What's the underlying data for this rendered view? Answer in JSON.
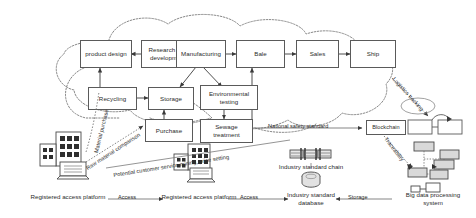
{
  "diagram": {
    "accent_color": "#5a5a5a",
    "background": "#ffffff"
  },
  "process_boxes": [
    {
      "id": "product-design",
      "label": "product design"
    },
    {
      "id": "research-development",
      "label": "Research and development"
    },
    {
      "id": "manufacturing",
      "label": "Manufacturing"
    },
    {
      "id": "bale",
      "label": "Bale"
    },
    {
      "id": "sales",
      "label": "Sales"
    },
    {
      "id": "ship",
      "label": "Ship"
    },
    {
      "id": "recycling",
      "label": "Recycling"
    },
    {
      "id": "storage",
      "label": "Storage"
    },
    {
      "id": "environmental-testing",
      "label": "Environmental testing"
    },
    {
      "id": "purchase",
      "label": "Purchase"
    },
    {
      "id": "sewage-treatment",
      "label": "Sewage treatment"
    },
    {
      "id": "blockchain",
      "label": "Blockchain"
    }
  ],
  "edge_labels": [
    {
      "id": "material-purchase",
      "text": "Material purchase"
    },
    {
      "id": "raw-material-comparison",
      "text": "Raw material comparison"
    },
    {
      "id": "potential-customer-service",
      "text": "Potential customer service mining, price setting"
    },
    {
      "id": "national-safety-standard",
      "text": "National safety standard"
    },
    {
      "id": "logistics-tracking",
      "text": "Logistics tracking"
    },
    {
      "id": "traceability",
      "text": "Traceability"
    },
    {
      "id": "access-left",
      "text": "Access"
    },
    {
      "id": "access-right",
      "text": "Access"
    },
    {
      "id": "storage-link",
      "text": "Storage"
    }
  ],
  "captions": [
    {
      "id": "registered-access-platform-left",
      "text": "Registered access platform"
    },
    {
      "id": "registered-access-platform-right",
      "text": "Registered access platform"
    },
    {
      "id": "industry-standard-chain",
      "text": "Industry standard chain"
    },
    {
      "id": "industry-standard-database",
      "text": "Industry standard database"
    },
    {
      "id": "big-data-processing-system",
      "text": "Big data processing system"
    }
  ],
  "icons": [
    {
      "id": "enterprise-buildings-icon",
      "name": "buildings-icon"
    },
    {
      "id": "laptop-left-icon",
      "name": "laptop-icon"
    },
    {
      "id": "enterprise-buildings-2-icon",
      "name": "buildings-icon"
    },
    {
      "id": "laptop-right-icon",
      "name": "laptop-icon"
    },
    {
      "id": "chain-links-icon",
      "name": "chain-icon"
    },
    {
      "id": "database-cylinder-icon",
      "name": "database-icon"
    },
    {
      "id": "server-cluster-icon",
      "name": "server-cluster-icon"
    },
    {
      "id": "blockchain-blocks-icon",
      "name": "blocks-icon"
    },
    {
      "id": "cloud-outline-icon",
      "name": "cloud-icon"
    }
  ]
}
